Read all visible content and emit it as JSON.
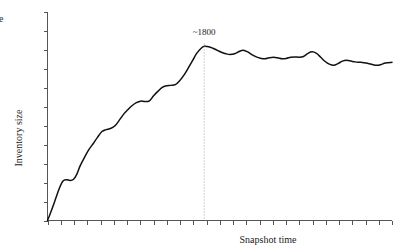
{
  "axes": {
    "ylabel": "Inventory size",
    "xlabel": "Snapshot time"
  },
  "annotations": {
    "peak_label": "~1800"
  },
  "corner": {
    "clipped_glyph": "e"
  },
  "chart_data": {
    "type": "line",
    "title": "",
    "subtitle": "",
    "xlabel": "Snapshot time",
    "ylabel": "Inventory size",
    "xlim": [
      0,
      1
    ],
    "ylim": [
      0,
      1
    ],
    "grid": false,
    "legend": null,
    "axis_tick_labels": {
      "x": [],
      "y": []
    },
    "x_tick_count": 27,
    "y_tick_count": 12,
    "annotations": [
      {
        "text": "~1800",
        "x": 0.455,
        "y": 0.93,
        "marker": "dotted-vertical-line",
        "note": "peak of inventory size curve"
      }
    ],
    "series": [
      {
        "name": "Inventory size",
        "color": "#111111",
        "x": [
          0.0,
          0.012,
          0.024,
          0.035,
          0.045,
          0.055,
          0.065,
          0.075,
          0.085,
          0.095,
          0.108,
          0.12,
          0.133,
          0.145,
          0.158,
          0.17,
          0.183,
          0.196,
          0.208,
          0.22,
          0.233,
          0.245,
          0.258,
          0.27,
          0.283,
          0.296,
          0.308,
          0.321,
          0.333,
          0.346,
          0.358,
          0.371,
          0.383,
          0.396,
          0.408,
          0.421,
          0.433,
          0.446,
          0.455,
          0.468,
          0.48,
          0.493,
          0.505,
          0.518,
          0.53,
          0.543,
          0.556,
          0.568,
          0.581,
          0.593,
          0.606,
          0.618,
          0.631,
          0.643,
          0.656,
          0.668,
          0.681,
          0.693,
          0.706,
          0.718,
          0.731,
          0.743,
          0.756,
          0.768,
          0.781,
          0.793,
          0.806,
          0.818,
          0.831,
          0.843,
          0.856,
          0.868,
          0.881,
          0.893,
          0.906,
          0.918,
          0.931,
          0.943,
          0.956,
          0.968,
          0.981,
          1.0
        ],
        "y": [
          0.0,
          0.055,
          0.115,
          0.17,
          0.205,
          0.212,
          0.208,
          0.213,
          0.24,
          0.285,
          0.33,
          0.368,
          0.4,
          0.432,
          0.462,
          0.472,
          0.478,
          0.492,
          0.52,
          0.55,
          0.575,
          0.596,
          0.612,
          0.62,
          0.618,
          0.622,
          0.648,
          0.672,
          0.692,
          0.7,
          0.702,
          0.706,
          0.725,
          0.755,
          0.79,
          0.83,
          0.868,
          0.895,
          0.905,
          0.903,
          0.895,
          0.884,
          0.874,
          0.866,
          0.862,
          0.866,
          0.878,
          0.884,
          0.876,
          0.862,
          0.85,
          0.843,
          0.84,
          0.845,
          0.848,
          0.845,
          0.84,
          0.842,
          0.848,
          0.85,
          0.848,
          0.852,
          0.868,
          0.876,
          0.868,
          0.848,
          0.826,
          0.812,
          0.806,
          0.815,
          0.828,
          0.832,
          0.828,
          0.824,
          0.822,
          0.82,
          0.816,
          0.81,
          0.806,
          0.81,
          0.818,
          0.822
        ]
      }
    ]
  }
}
